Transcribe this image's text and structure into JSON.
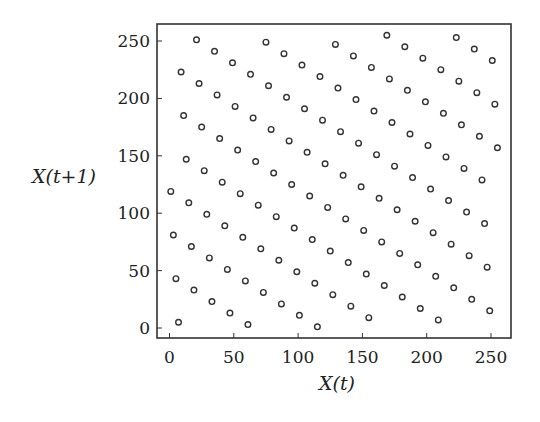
{
  "chart_data": {
    "type": "scatter",
    "title": "",
    "xlabel": "X(t)",
    "ylabel": "X(t+1)",
    "xlim": [
      -8,
      267
    ],
    "ylim": [
      -9,
      264
    ],
    "xticks": [
      0,
      50,
      100,
      150,
      200,
      250
    ],
    "yticks": [
      0,
      50,
      100,
      150,
      200,
      250
    ],
    "xtick_labels": [
      "0",
      "50",
      "100",
      "150",
      "200",
      "250"
    ],
    "ytick_labels": [
      "0",
      "50",
      "100",
      "150",
      "200",
      "250"
    ],
    "grid": false,
    "legend": null,
    "marker": "open-circle",
    "marker_color": "#333333",
    "series": [
      {
        "name": "X(t) vs X(t+1)",
        "x": [
          1,
          3,
          5,
          7,
          9,
          11,
          13,
          15,
          17,
          19,
          21,
          23,
          25,
          27,
          29,
          31,
          33,
          35,
          37,
          39,
          41,
          43,
          45,
          47,
          49,
          51,
          53,
          55,
          57,
          59,
          61,
          63,
          65,
          67,
          69,
          71,
          73,
          75,
          77,
          79,
          81,
          83,
          85,
          87,
          89,
          91,
          93,
          95,
          97,
          99,
          101,
          103,
          105,
          107,
          109,
          111,
          113,
          115,
          117,
          119,
          121,
          123,
          125,
          127,
          129,
          131,
          133,
          135,
          137,
          139,
          141,
          143,
          145,
          147,
          149,
          151,
          153,
          155,
          157,
          159,
          161,
          163,
          165,
          167,
          169,
          171,
          173,
          175,
          177,
          179,
          181,
          183,
          185,
          187,
          189,
          191,
          193,
          195,
          197,
          199,
          201,
          203,
          205,
          207,
          209,
          211,
          213,
          215,
          217,
          219,
          221,
          223,
          225,
          227,
          229,
          231,
          233,
          235,
          237,
          239,
          241,
          243,
          245,
          247,
          249,
          251,
          253,
          255
        ],
        "y": [
          119,
          81,
          43,
          5,
          223,
          185,
          147,
          109,
          71,
          33,
          251,
          213,
          175,
          137,
          99,
          61,
          23,
          241,
          203,
          165,
          127,
          89,
          51,
          13,
          231,
          193,
          155,
          117,
          79,
          41,
          3,
          221,
          183,
          145,
          107,
          69,
          31,
          249,
          211,
          173,
          135,
          97,
          59,
          21,
          239,
          201,
          163,
          125,
          87,
          49,
          11,
          229,
          191,
          153,
          115,
          77,
          39,
          1,
          219,
          181,
          143,
          105,
          67,
          29,
          247,
          209,
          171,
          133,
          95,
          57,
          19,
          237,
          199,
          161,
          123,
          85,
          47,
          9,
          227,
          189,
          151,
          113,
          75,
          37,
          255,
          217,
          179,
          141,
          103,
          65,
          27,
          245,
          207,
          169,
          131,
          93,
          55,
          17,
          235,
          197,
          159,
          121,
          83,
          45,
          7,
          225,
          187,
          149,
          111,
          73,
          35,
          253,
          215,
          177,
          139,
          101,
          63,
          25,
          243,
          205,
          167,
          129,
          91,
          53,
          15,
          233,
          195,
          157
        ]
      }
    ]
  }
}
